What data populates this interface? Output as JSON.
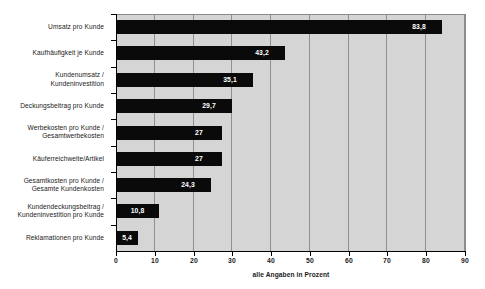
{
  "chart_data": {
    "type": "bar",
    "orientation": "horizontal",
    "title": "",
    "subtitle": "",
    "xlabel": "alle Angaben in Prozent",
    "ylabel": "",
    "xlim": [
      0,
      90
    ],
    "xticks": [
      "0",
      "10",
      "20",
      "30",
      "40",
      "50",
      "60",
      "70",
      "80",
      "90"
    ],
    "grid": true,
    "legend": false,
    "categories": [
      "Umsatz pro Kunde",
      "Kaufhäufigkeit je Kunde",
      "Kundenumsatz / Kundeninvestition",
      "Deckungsbeitrag pro Kunde",
      "Werbekosten pro Kunde / Gesamtwerbekosten",
      "Käuferreichweite/Artikel",
      "Gesamtkosten pro Kunde / Gesamte Kundenkosten",
      "Kundendeckungsbeitrag / Kundeninvestition pro Kunde",
      "Reklamationen pro Kunde"
    ],
    "category_lines": [
      [
        "Umsatz pro Kunde"
      ],
      [
        "Kaufhäufigkeit je Kunde"
      ],
      [
        "Kundenumsatz /",
        "Kundeninvestition"
      ],
      [
        "Deckungsbeitrag pro Kunde"
      ],
      [
        "Werbekosten pro Kunde /",
        "Gesamtwerbekosten"
      ],
      [
        "Käuferreichweite/Artikel"
      ],
      [
        "Gesamtkosten pro Kunde /",
        "Gesamte Kundenkosten"
      ],
      [
        "Kundendeckungsbeitrag /",
        "Kundeninvestition pro Kunde"
      ],
      [
        "Reklamationen pro Kunde"
      ]
    ],
    "values": [
      83.8,
      43.2,
      35.1,
      29.7,
      27,
      27,
      24.3,
      10.8,
      5.4
    ],
    "value_labels": [
      "83,8",
      "43,2",
      "35,1",
      "29,7",
      "27",
      "27",
      "24,3",
      "10,8",
      "5,4"
    ],
    "colors": {
      "bar": "#0a0a0a",
      "plot_background": "#d5d5d5",
      "page_background": "#ffffff",
      "gridline": "#8f8f8f",
      "axis": "#000000",
      "value_label": "#ffffff",
      "tick_label": "#1a1a1a"
    }
  }
}
